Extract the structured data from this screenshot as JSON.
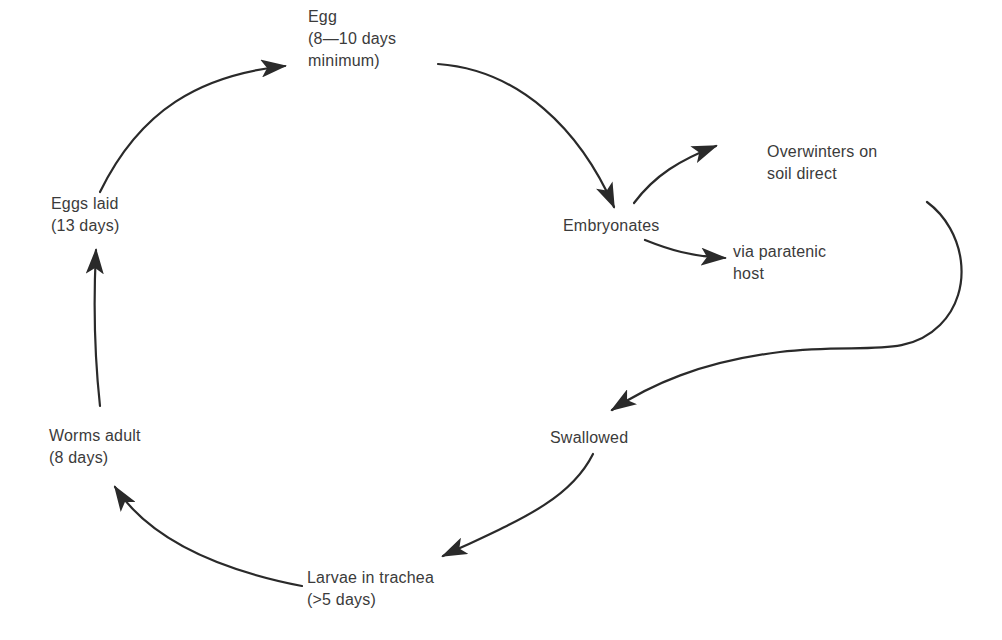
{
  "diagram": {
    "type": "life-cycle",
    "colors": {
      "background": "#ffffff",
      "text": "#3b3b3b",
      "arrow": "#2a2a2a"
    },
    "nodes": {
      "egg": {
        "line1": "Egg",
        "line2": "(8—10 days",
        "line3": "minimum)"
      },
      "embryonates": {
        "line1": "Embryonates"
      },
      "overwinters": {
        "line1": "Overwinters on",
        "line2": "soil direct"
      },
      "paratenic": {
        "line1": "via paratenic",
        "line2": "host"
      },
      "swallowed": {
        "line1": "Swallowed"
      },
      "larvae": {
        "line1": "Larvae in trachea",
        "line2": "(>5 days)"
      },
      "worms_adult": {
        "line1": "Worms adult",
        "line2": "(8 days)"
      },
      "eggs_laid": {
        "line1": "Eggs laid",
        "line2": "(13 days)"
      }
    },
    "edges": [
      {
        "from": "Egg",
        "to": "Embryonates"
      },
      {
        "from": "Embryonates",
        "to": "Overwinters on soil direct"
      },
      {
        "from": "Embryonates",
        "to": "via paratenic host"
      },
      {
        "from": "Overwinters on soil direct",
        "to": "Swallowed"
      },
      {
        "from": "Swallowed",
        "to": "Larvae in trachea"
      },
      {
        "from": "Larvae in trachea",
        "to": "Worms adult"
      },
      {
        "from": "Worms adult",
        "to": "Eggs laid"
      },
      {
        "from": "Eggs laid",
        "to": "Egg"
      }
    ]
  }
}
